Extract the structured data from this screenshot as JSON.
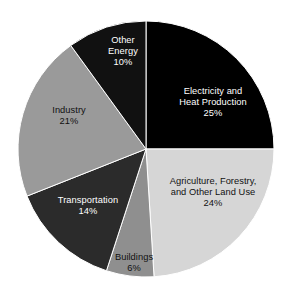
{
  "chart_data": {
    "type": "pie",
    "title": "",
    "subtitle": "",
    "xlabel": "",
    "ylabel": "",
    "legend_position": "none",
    "grid": false,
    "labels_inside_slices": true,
    "total_percent": 100,
    "categories": [
      "Electricity and Heat Production",
      "Agriculture, Forestry, and Other Land Use",
      "Buildings",
      "Transportation",
      "Industry",
      "Other Energy"
    ],
    "values": [
      25,
      24,
      6,
      14,
      21,
      10
    ],
    "value_suffix": "%",
    "colors": [
      "#000000",
      "#d6d6d6",
      "#8f8f8f",
      "#2b2b2b",
      "#9a9a9a",
      "#111111"
    ],
    "slices": [
      {
        "name": "Electricity and Heat Production",
        "label_line1": "Electricity and",
        "label_line2": "Heat Production",
        "value": 25,
        "value_label": "25%",
        "color": "#000000",
        "text_color": "#ffffff",
        "start_angle_deg": 0,
        "end_angle_deg": 90
      },
      {
        "name": "Agriculture, Forestry, and Other Land Use",
        "label_line1": "Agriculture, Forestry,",
        "label_line2": "and Other Land Use",
        "value": 24,
        "value_label": "24%",
        "color": "#d6d6d6",
        "text_color": "#111111",
        "start_angle_deg": 90,
        "end_angle_deg": 176.4
      },
      {
        "name": "Buildings",
        "label_line1": "Buildings",
        "label_line2": "",
        "value": 6,
        "value_label": "6%",
        "color": "#8f8f8f",
        "text_color": "#111111",
        "start_angle_deg": 176.4,
        "end_angle_deg": 198
      },
      {
        "name": "Transportation",
        "label_line1": "Transportation",
        "label_line2": "",
        "value": 14,
        "value_label": "14%",
        "color": "#2b2b2b",
        "text_color": "#ffffff",
        "start_angle_deg": 198,
        "end_angle_deg": 248.4
      },
      {
        "name": "Industry",
        "label_line1": "Industry",
        "label_line2": "",
        "value": 21,
        "value_label": "21%",
        "color": "#9a9a9a",
        "text_color": "#111111",
        "start_angle_deg": 248.4,
        "end_angle_deg": 324
      },
      {
        "name": "Other Energy",
        "label_line1": "Other",
        "label_line2": "Energy",
        "value": 10,
        "value_label": "10%",
        "color": "#111111",
        "text_color": "#ffffff",
        "start_angle_deg": 324,
        "end_angle_deg": 360
      }
    ]
  },
  "figure": {
    "background": "#ffffff",
    "center_x": 146,
    "center_y": 149,
    "radius": 128
  }
}
